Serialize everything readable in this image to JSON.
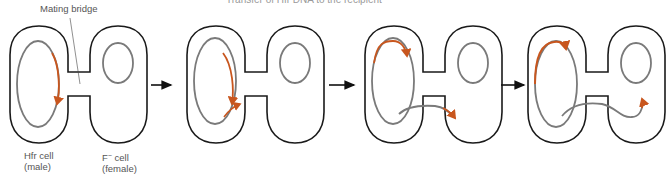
{
  "figure": {
    "title_partial": "Transfer of Hfr DNA to the F⁻ recipient",
    "labels": {
      "mating_bridge": "Mating bridge",
      "hfr_cell_line1": "Hfr cell",
      "hfr_cell_line2": "(male)",
      "f_cell_base": "F",
      "f_cell_sup": "−",
      "f_cell_rest": " cell",
      "f_cell_line2": "(female)"
    },
    "panels": [
      {
        "step": 1,
        "description": "Hfr chromosome begins replication at origin"
      },
      {
        "step": 2,
        "description": "Replicated strand begins entering the mating bridge"
      },
      {
        "step": 3,
        "description": "Single strand transferred through bridge into F- cell"
      },
      {
        "step": 4,
        "description": "Transferred DNA extends further into F- cell"
      }
    ],
    "colors": {
      "cell_outline": "#1a1a1a",
      "chromosome": "#7a7a7a",
      "transfer_dna": "#c8561e",
      "arrow": "#111111",
      "text": "#555555"
    }
  }
}
